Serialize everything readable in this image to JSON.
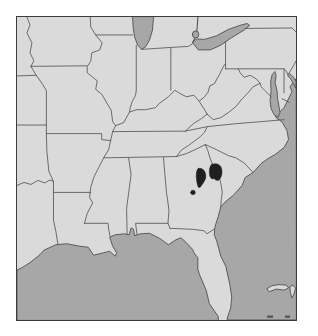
{
  "figure": {
    "type": "range-map",
    "region": "southeastern-united-states",
    "content": "distribution range map with two dark range blobs and one locality dot in east-central Georgia near the Savannah River"
  },
  "palette": {
    "page_bg": "#ffffff",
    "land": "#dadada",
    "water": "#a7a7a7",
    "coastline": "#4f4f4f",
    "border_line": "#555555",
    "mark": "#1f1f1f",
    "frame": "#3c3c3c"
  },
  "canvas": {
    "width": 318,
    "height": 336,
    "map_left": 16,
    "map_top": 16,
    "map_width": 281,
    "map_height": 305,
    "viewbox": "0 0 280 304"
  },
  "range_data": {
    "marks": [
      {
        "name": "range-blob-west",
        "location": "east-central Georgia",
        "approx_px": [
          184,
          160
        ]
      },
      {
        "name": "range-blob-east",
        "location": "Georgia / South Carolina border near Savannah River",
        "approx_px": [
          199,
          155
        ]
      },
      {
        "name": "locality-dot",
        "location": "central Georgia",
        "approx_px": [
          176,
          176
        ]
      }
    ]
  },
  "map": {
    "layers": [
      {
        "name": "land-base",
        "kind": "land",
        "d": "M0,0 H280 V304 H0 Z"
      },
      {
        "name": "gulf-of-mexico",
        "kind": "water",
        "d": "M202,304 L202,300.5 L193,287.5 L190,274.5 L183,258 L181.5,253 L181.5,241.5 L177.5,236.5 L176.5,233.5 L168.5,225 L164.5,221.5 L159.5,223.5 L152,228.5 L143,222 L133,217 L124,217.5 L120.5,218.5 L118,219.5 L117,213 L114.5,211.5 L112.5,218.5 L107.5,217.5 L98.5,218.5 L93,221 L96,230 L100,236.5 L98.5,240 L93,235 L87,236.5 L77,239 L71.5,231 L63,230 L50,227.5 L39,228.5 L27,234 L23,238.5 L13,246.5 L5,251.5 L0,254 L0,304 Z"
      },
      {
        "name": "atlantic-ocean",
        "kind": "water",
        "d": "M280,62 L277,66 L274,70 L276,75 L272,83 L268,91 L263,96 L259,99 L261,102 L264,103.5 L267,107 L271,114 L272.5,123 L268,131 L259,138 L252,142 L245,147 L237,156 L229,161 L226,169 L217,179 L210,184.5 L204.5,190.5 L202,200 L198.5,211 L198,218.5 L200.5,225 L204.5,240 L209.5,250 L213.5,268 L215.5,281 L214.5,292 L211,302 L211,304 L280,304 Z"
      },
      {
        "name": "lake-michigan",
        "kind": "water",
        "d": "M116,0 L116.5,10 L118,20 L121,28 L125,32.5 L129,30 L133,23 L136,13 L137,0 Z"
      },
      {
        "name": "lake-erie",
        "kind": "water",
        "d": "M176,25.5 L182,33 L194,33 L204,28.5 L215,21 L228,13 L233.5,8.5 L231,6.5 L225,8 L212,12.5 L200,19 L188,22.5 L181,22 Z"
      },
      {
        "name": "lake-st-clair",
        "kind": "water",
        "d": "M176,17.5 a3.2,3.6 0 1 0 6.4,0 a3.2,3.6 0 1 0 -6.4,0 Z"
      },
      {
        "name": "chesapeake-bay",
        "kind": "water",
        "d": "M258.5,55 L256,58 L254.5,65 L255,74 L254,84 L255,92 L258,98 L262,100.5 L264,96 L263,90 L261.5,82 L261,74 L259,66 L260,59 Z"
      },
      {
        "name": "delaware-bay",
        "kind": "water",
        "d": "M272,59 L274.5,62 L277.5,67 L280,71.5 L280,64.5 L277,60 L274,57 Z"
      },
      {
        "name": "grand-bahama-island",
        "kind": "island",
        "d": "M251,272.5 L256,269.5 L263,268.5 L270,269 L272.5,271.5 L268.5,274 L260,273 L253.5,275.5 Z"
      },
      {
        "name": "abaco-island",
        "kind": "island",
        "d": "M274,270.5 L277,269 L279.5,272 L278,278 L276,282 L274.5,277 Z"
      },
      {
        "name": "islet-dash-west",
        "kind": "dark-islet",
        "d": "M251,299.5 h6 v2.3 h-6 Z"
      },
      {
        "name": "islet-dash-east",
        "kind": "dark-islet",
        "d": "M269,299.5 h5 v2.3 h-5 Z"
      },
      {
        "name": "missouri-river-iowa-nebraska",
        "kind": "border",
        "d": "M10,0 L13,8 L10,16 L15,26 L13,36 L17,44 L14,49.5"
      },
      {
        "name": "iowa-missouri-line",
        "kind": "border",
        "d": "M14,49.5 L70,49"
      },
      {
        "name": "missouri-west-line",
        "kind": "border",
        "d": "M14,49.5 L19,58 L26,68 L29.5,74 L29.5,117"
      },
      {
        "name": "kansas-nebraska-line",
        "kind": "border",
        "d": "M0,59.1 L19.5,58.5"
      },
      {
        "name": "kansas-oklahoma-line",
        "kind": "border",
        "d": "M0,108.4 L29.5,108.4"
      },
      {
        "name": "missouri-arkansas-line",
        "kind": "border",
        "d": "M29.5,117 L85,117 L85,123 L94,124"
      },
      {
        "name": "arkansas-oklahoma-line",
        "kind": "border",
        "d": "M29.5,117 L30,135 L32,155 L36.6,165"
      },
      {
        "name": "red-river-line",
        "kind": "border",
        "d": "M0,169 L7,166 L14,168 L21,164 L28,166.5 L33,163.5 L36.6,165"
      },
      {
        "name": "texas-louisiana-line",
        "kind": "border",
        "d": "M36.6,165 L36.6,204 L39,215 L41,227.5"
      },
      {
        "name": "arkansas-louisiana-line",
        "kind": "border",
        "d": "M36.6,176 L74,176"
      },
      {
        "name": "mississippi-river",
        "kind": "border",
        "d": "M73.5,0 L74,10 L79,18 L85.5,26 L83,33 L75,36 L74,44.5 L70.5,49.5 L70.5,56 L80.5,64 L79,72.5 L85.5,78 L90.5,87 L94.5,93.5 L96,105 L99,109 L96,115 L94,124 L92,133 L87,141.3 L82,151 L77,161 L74,171 L72.8,181 L76,186.5 L70.5,197 L67.7,207"
      },
      {
        "name": "louisiana-mississippi-line",
        "kind": "border",
        "d": "M67.7,207 L91.4,207 L92,213 L93.5,220"
      },
      {
        "name": "wisconsin-illinois-line",
        "kind": "border",
        "d": "M79,18 L116,18"
      },
      {
        "name": "illinois-indiana-line",
        "kind": "border",
        "d": "M119.7,28.5 L119.7,74 L118.8,79 L116,84 L113.7,90.5 L113,95.3"
      },
      {
        "name": "ohio-river",
        "kind": "border",
        "d": "M99,109 L107,106 L113,95.3 L120,93 L129,93 L139,91 L143,86.5 L152,80 L158.5,73.5 L163,76.5 L170,80 L177.6,78.5 L182.7,84.5 L187.8,80.5 L191.7,75.5 L193.6,69 L198,67 L203,58 L207.7,48.5 L209.3,47"
      },
      {
        "name": "michigan-south-line",
        "kind": "border",
        "d": "M125,32.5 L140,31.5 L155,30.5 L172,29.5 L176,27"
      },
      {
        "name": "indiana-ohio-line",
        "kind": "border",
        "d": "M154.4,73.5 L154.4,30.8"
      },
      {
        "name": "ohio-pennsylvania-line",
        "kind": "border",
        "d": "M209.3,24.5 L209.3,52"
      },
      {
        "name": "mason-dixon-line",
        "kind": "border",
        "d": "M209.3,52 L268,52 L270,54 L272,58"
      },
      {
        "name": "delaware-river-nj-line",
        "kind": "border",
        "d": "M272,58 L275,53 L278,48 L280,44"
      },
      {
        "name": "delaware-maryland-line",
        "kind": "border",
        "d": "M268,52 L268,76"
      },
      {
        "name": "delmarva-md-va-line",
        "kind": "border",
        "d": "M266,82 L273,85.5"
      },
      {
        "name": "potomac-river",
        "kind": "border",
        "d": "M255,80 L249,74 L245,70 L244,66.5 L240,62 L234,58.5 L228,60.5 L224,56 L222,52"
      },
      {
        "name": "west-virginia-virginia-line",
        "kind": "border",
        "d": "M244,66.5 L237,70 L231,77 L226,82 L220,89.5 L212,96 L204.5,101 L197,103 L190.8,97.5"
      },
      {
        "name": "west-virginia-kentucky-line",
        "kind": "border",
        "d": "M190.8,97.5 L187,91 L183,85"
      },
      {
        "name": "kentucky-virginia-line",
        "kind": "border",
        "d": "M190.8,97.5 L185,102 L177,107 L169,114.5"
      },
      {
        "name": "kentucky-tennessee-line",
        "kind": "border",
        "d": "M95.9,115 L169,114.5"
      },
      {
        "name": "virginia-north-carolina-line",
        "kind": "border",
        "d": "M169,114.5 L191,110 L220,107 L245,105 L268,103"
      },
      {
        "name": "tennessee-south-line",
        "kind": "border",
        "d": "M87,141.3 L160,140"
      },
      {
        "name": "tennessee-north-carolina-line",
        "kind": "border",
        "d": "M160,140 L165,133.5 L172,129 L178,124.5 L184,120 L188,116 L191,110"
      },
      {
        "name": "georgia-north-carolina-line",
        "kind": "border",
        "d": "M160,140 L170,137 L180,132.5 L189,128"
      },
      {
        "name": "mississippi-alabama-line",
        "kind": "border",
        "d": "M112,141.2 L114.5,158 L110,192 L110.5,218.5"
      },
      {
        "name": "alabama-georgia-line",
        "kind": "border",
        "d": "M147,141 L150,176 L151,182.5 L152.5,194 L151.5,207 L153.5,212"
      },
      {
        "name": "alabama-florida-line",
        "kind": "border",
        "d": "M151.5,207 L119,207 L120.5,218.5"
      },
      {
        "name": "georgia-florida-line",
        "kind": "border",
        "d": "M153.5,212 L176,213 L188,214.5 L190.5,217.5 L197.8,213"
      },
      {
        "name": "savannah-river-ga-sc-line",
        "kind": "border",
        "d": "M189,128 L191.5,134 L193.5,141 L196.5,148.5 L200.5,156 L203.5,162.5 L205,169 L206,176 L205,183 L204.5,190.5"
      },
      {
        "name": "north-carolina-south-carolina-line",
        "kind": "border",
        "d": "M189,128 L200,133 L212,139 L220,141.5 L228,146.5 L237,156"
      },
      {
        "name": "pennsylvania-north-line",
        "kind": "border",
        "d": "M229,11.5 L276,11 L280,15"
      },
      {
        "name": "st-clair-river",
        "kind": "river",
        "d": "M181.5,0 L181,8 L180.5,14"
      },
      {
        "name": "st-clair-outlet",
        "kind": "river",
        "d": "M178.5,21 L176.5,25.5"
      },
      {
        "name": "range-blob-west",
        "kind": "mark",
        "d": "M182,152 C186,150.8 189,154.5 189.5,158.5 C190,162.5 187.3,166 185.2,169 C184.2,171 182.2,172 181.6,170 C180.3,166 179.6,161 180,157 C180.3,154 181,152.6 182,152 Z"
      },
      {
        "name": "range-blob-east",
        "kind": "mark",
        "d": "M195.5,147.8 C199.5,146.3 203.6,147.4 205,151 C206.4,155 205.8,159 203.8,162.2 C202.2,164.8 199.2,164.3 197.6,161.8 C196.4,163.4 194.2,162 193.4,159 C192.6,155 193,149.8 195.5,147.8 Z"
      },
      {
        "name": "locality-dot",
        "kind": "mark",
        "d": "M174.3,176 a2.3,2.3 0 1 0 4.6,0 a2.3,2.3 0 1 0 -4.6,0 Z"
      }
    ]
  }
}
